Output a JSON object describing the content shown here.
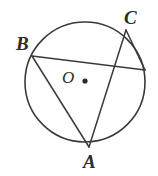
{
  "figure": {
    "type": "circle-geometry-diagram",
    "width": 158,
    "height": 176,
    "background_color": "#ffffff",
    "stroke_color": "#3a3a3a",
    "label_color": "#2b2b2b",
    "circle": {
      "center_label": "O",
      "center_x": 85,
      "center_y": 82,
      "radius": 60
    },
    "center_dot": {
      "name": "center-point-O",
      "x": 85,
      "y": 81,
      "r": 2.6
    },
    "points": [
      {
        "label": "B",
        "x": 32,
        "y": 56,
        "label_x": 16,
        "label_y": 34
      },
      {
        "label": "C",
        "x": 126,
        "y": 30,
        "label_x": 124,
        "label_y": 8
      },
      {
        "label": "A",
        "x": 89,
        "y": 147,
        "label_x": 83,
        "label_y": 152
      },
      {
        "label": "",
        "x": 144,
        "y": 70,
        "label_x": 0,
        "label_y": 0
      }
    ],
    "segments": [
      {
        "name": "chord-B-to-right",
        "x1": 32,
        "y1": 56,
        "x2": 145,
        "y2": 70
      },
      {
        "name": "chord-B-to-A",
        "x1": 32,
        "y1": 56,
        "x2": 89,
        "y2": 147
      },
      {
        "name": "chord-A-to-C",
        "x1": 89,
        "y1": 147,
        "x2": 126,
        "y2": 30
      },
      {
        "name": "chord-C-to-right",
        "x1": 126,
        "y1": 30,
        "x2": 145,
        "y2": 70
      }
    ],
    "labels": {
      "A": "A",
      "B": "B",
      "C": "C",
      "O": "O"
    }
  }
}
